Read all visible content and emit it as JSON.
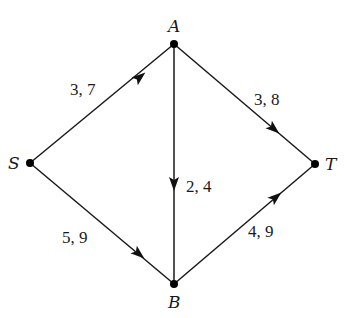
{
  "diagram": {
    "type": "directed-flow-network",
    "nodes": [
      {
        "id": "S",
        "label": "S",
        "x": 30,
        "y": 163
      },
      {
        "id": "A",
        "label": "A",
        "x": 174,
        "y": 44
      },
      {
        "id": "B",
        "label": "B",
        "x": 174,
        "y": 284
      },
      {
        "id": "T",
        "label": "T",
        "x": 315,
        "y": 164
      }
    ],
    "edges": [
      {
        "from": "S",
        "to": "A",
        "label": "3, 7"
      },
      {
        "from": "A",
        "to": "T",
        "label": "3, 8"
      },
      {
        "from": "A",
        "to": "B",
        "label": "2, 4"
      },
      {
        "from": "S",
        "to": "B",
        "label": "5, 9"
      },
      {
        "from": "B",
        "to": "T",
        "label": "4, 9"
      }
    ],
    "colors": {
      "line": "#1a1a1a",
      "node": "#000000",
      "background": "#ffffff"
    }
  }
}
